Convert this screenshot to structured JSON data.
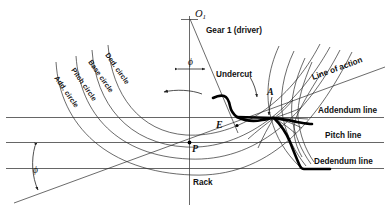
{
  "figure": {
    "title_label": "Gear 1 (driver)",
    "rack_label": "Rack",
    "center_label": "O",
    "center_sub": "1",
    "undercut_label": "Undercut",
    "line_of_action_label": "Line of action",
    "addendum_line_label": "Addendum line",
    "pitch_line_label": "Pitch line",
    "dedendum_line_label": "Dedendum line",
    "pressure_angle_symbol_top": "ϕ",
    "pressure_angle_symbol_bottom": "ϕ",
    "point_A": "A",
    "point_E": "E",
    "point_P": "P"
  },
  "arcs": [
    {
      "name": "add-circle",
      "label": "Add. circle"
    },
    {
      "name": "pitch-circle",
      "label": "Pitch circle"
    },
    {
      "name": "base-circle",
      "label": "Base circle"
    },
    {
      "name": "ded-circle",
      "label": "Ded. circle"
    }
  ],
  "colors": {
    "background": "#ffffff",
    "ink": "#111111",
    "thin_line": "#2b2b2b",
    "rule_line": "#555555",
    "profile": "#000000"
  },
  "icons": {
    "rotation_arrow": "rotation-arrow-icon",
    "undercut_pointer": "undercut-arrow-icon",
    "angle_arrow_top": "angle-double-arrow-icon",
    "angle_arrow_bottom": "angle-double-arrow-icon"
  }
}
